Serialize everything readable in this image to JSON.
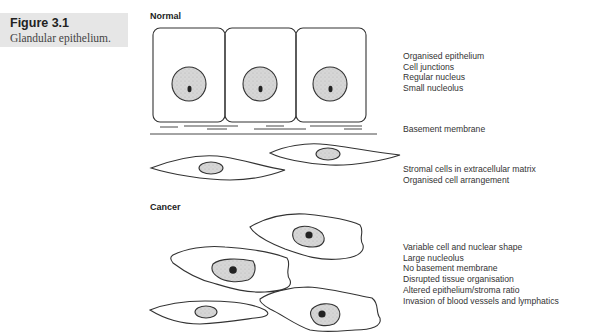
{
  "figure": {
    "number": "Figure 3.1",
    "caption": "Glandular epithelium."
  },
  "normal": {
    "label": "Normal",
    "notes_cells": [
      "Organised epithelium",
      "Cell junctions",
      "Regular nucleus",
      "Small nucleolus"
    ],
    "notes_membrane": [
      "Basement membrane"
    ],
    "notes_stroma": [
      "Stromal cells in extracellular matrix",
      "Organised cell arrangement"
    ]
  },
  "cancer": {
    "label": "Cancer",
    "notes": [
      "Variable cell and nuclear shape",
      "Large nucleolus",
      "No basement membrane",
      "Disrupted tissue organisation",
      "Altered epithelium/stroma ratio",
      "Invasion of blood vessels and lymphatics"
    ]
  },
  "colors": {
    "caption_bg": "#e6e6e6",
    "outline": "#333333",
    "nucleus_fill": "#d4d4d4",
    "nucleolus_fill": "#222222"
  }
}
